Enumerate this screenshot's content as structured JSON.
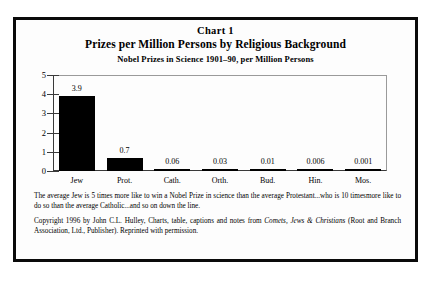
{
  "figure": {
    "chart_number": "Chart 1",
    "title": "Prizes per Million Persons by Religious Background",
    "subtitle": "Nobel Prizes in Science 1901–90, per Million Persons"
  },
  "caption": {
    "text": "The average Jew is 5 times more like to win a Nobel Prize in science than the average Protestant...who is  10 timesmore like to do so than the average Catholic...and so on down the line."
  },
  "copyright": {
    "part1": "Copyright 1996 by John C.L. Hulley, Charts, table, captions and notes from ",
    "book_title": "Comets, Jews & Christians",
    "part2": " (Root and Branch Association, Ltd., Publisher).  Reprinted with permission."
  },
  "chart_data": {
    "type": "bar",
    "title": "Prizes per Million Persons by Religious Background",
    "subtitle": "Nobel Prizes in Science 1901–90, per Million Persons",
    "xlabel": "",
    "ylabel": "",
    "categories": [
      "Jew",
      "Prot.",
      "Cath.",
      "Orth.",
      "Bud.",
      "Hin.",
      "Mos."
    ],
    "values": [
      3.9,
      0.7,
      0.06,
      0.03,
      0.01,
      0.006,
      0.001
    ],
    "value_labels": [
      "3.9",
      "0.7",
      "0.06",
      "0.03",
      "0.01",
      "0.006",
      "0.001"
    ],
    "ylim": [
      0,
      5
    ],
    "yticks": [
      0,
      1,
      2,
      3,
      4,
      5
    ],
    "ytick_labels": [
      "0",
      "1",
      "2",
      "3",
      "4",
      "5"
    ],
    "grid": false,
    "legend": "none",
    "bar_color": "#000000",
    "background_color": "#fdfdfd"
  }
}
